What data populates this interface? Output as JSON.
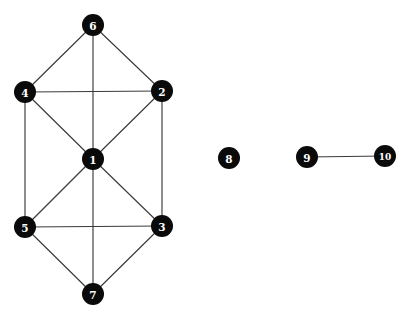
{
  "figure": {
    "width": 409,
    "height": 319,
    "background_color": "#ffffff",
    "node_fill_color": "#0a0a0a",
    "node_label_color": "#ffffff",
    "edge_color": "#3a3a3a",
    "node_radius": 11
  },
  "nodes": [
    {
      "id": "1",
      "label": "1",
      "x": 93,
      "y": 159
    },
    {
      "id": "2",
      "label": "2",
      "x": 162,
      "y": 91
    },
    {
      "id": "3",
      "label": "3",
      "x": 162,
      "y": 226
    },
    {
      "id": "4",
      "label": "4",
      "x": 25,
      "y": 92
    },
    {
      "id": "5",
      "label": "5",
      "x": 25,
      "y": 227
    },
    {
      "id": "6",
      "label": "6",
      "x": 93,
      "y": 25
    },
    {
      "id": "7",
      "label": "7",
      "x": 93,
      "y": 294
    },
    {
      "id": "8",
      "label": "8",
      "x": 229,
      "y": 158
    },
    {
      "id": "9",
      "label": "9",
      "x": 307,
      "y": 157
    },
    {
      "id": "10",
      "label": "10",
      "x": 385,
      "y": 156
    }
  ],
  "edges": [
    {
      "source": "6",
      "target": "4"
    },
    {
      "source": "6",
      "target": "2"
    },
    {
      "source": "6",
      "target": "1"
    },
    {
      "source": "4",
      "target": "2"
    },
    {
      "source": "4",
      "target": "1"
    },
    {
      "source": "4",
      "target": "5"
    },
    {
      "source": "2",
      "target": "1"
    },
    {
      "source": "2",
      "target": "3"
    },
    {
      "source": "1",
      "target": "5"
    },
    {
      "source": "1",
      "target": "3"
    },
    {
      "source": "1",
      "target": "7"
    },
    {
      "source": "5",
      "target": "3"
    },
    {
      "source": "5",
      "target": "7"
    },
    {
      "source": "3",
      "target": "7"
    },
    {
      "source": "9",
      "target": "10"
    }
  ],
  "components": [
    {
      "name": "component-main",
      "members": [
        "1",
        "2",
        "3",
        "4",
        "5",
        "6",
        "7"
      ]
    },
    {
      "name": "component-isolated",
      "members": [
        "8"
      ]
    },
    {
      "name": "component-pair",
      "members": [
        "9",
        "10"
      ]
    }
  ]
}
